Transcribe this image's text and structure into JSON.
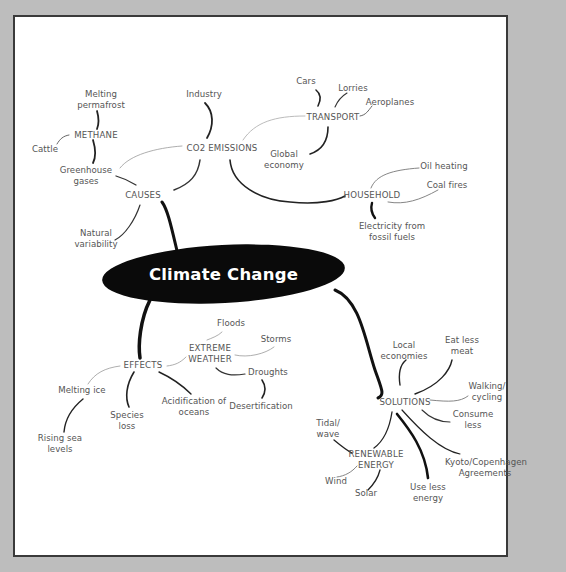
{
  "title": "Climate Change",
  "colors": {
    "background": "#bdbdbd",
    "panel": "#ffffff",
    "border": "#3a3a3a",
    "central_node": "#0a0a0a",
    "central_text": "#ffffff",
    "label_text": "#555555",
    "thick_link": "#111111",
    "thin_link": "#999999"
  },
  "branches": {
    "causes": {
      "label": "CAUSES",
      "children": {
        "natural_variability": "Natural variability",
        "greenhouse_gases": {
          "label": "Greenhouse gases",
          "methane": {
            "label": "METHANE",
            "melting_permafrost": "Melting permafrost",
            "cattle": "Cattle"
          }
        },
        "co2_emissions": {
          "label": "CO2 EMISSIONS",
          "industry": "Industry",
          "transport": {
            "label": "TRANSPORT",
            "cars": "Cars",
            "lorries": "Lorries",
            "aeroplanes": "Aeroplanes",
            "global_economy": "Global economy"
          },
          "household": {
            "label": "HOUSEHOLD",
            "oil_heating": "Oil heating",
            "coal_fires": "Coal fires",
            "electricity": "Electricity from fossil fuels"
          }
        }
      }
    },
    "effects": {
      "label": "EFFECTS",
      "melting_ice": "Melting ice",
      "rising_sea_levels": "Rising sea levels",
      "species_loss": "Species loss",
      "acidification": "Acidification of oceans",
      "extreme_weather": {
        "label": "EXTREME WEATHER",
        "floods": "Floods",
        "storms": "Storms",
        "droughts": "Droughts",
        "desertification": "Desertification"
      }
    },
    "solutions": {
      "label": "SOLUTIONS",
      "local_economies": "Local economies",
      "eat_less_meat": "Eat less meat",
      "walking_cycling": "Walking/ cycling",
      "consume_less": "Consume less",
      "kyoto": "Kyoto/Copenhagen Agreements",
      "use_less_energy": "Use less energy",
      "renewable_energy": {
        "label": "RENEWABLE ENERGY",
        "tidal_wave": "Tidal/ wave",
        "wind": "Wind",
        "solar": "Solar"
      }
    }
  }
}
